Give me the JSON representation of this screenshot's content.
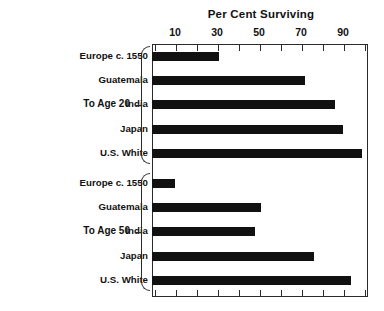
{
  "chart_data": {
    "type": "bar",
    "orientation": "horizontal",
    "title": "Per Cent Surviving",
    "xlabel": "",
    "ylabel": "",
    "xlim": [
      0,
      102
    ],
    "grid": false,
    "legend": false,
    "tick_labels": [
      "10",
      "30",
      "50",
      "70",
      "90"
    ],
    "tick_values": [
      10,
      30,
      50,
      70,
      90
    ],
    "minor_tick_values": [
      0,
      10,
      20,
      30,
      40,
      50,
      60,
      70,
      80,
      90,
      100
    ],
    "groups": [
      {
        "label": "To Age 20",
        "categories": [
          "Europe c. 1550",
          "Guatemala",
          "India",
          "Japan",
          "U.S. White"
        ],
        "values": [
          31,
          72,
          86,
          90,
          99
        ]
      },
      {
        "label": "To Age 50",
        "categories": [
          "Europe c. 1550",
          "Guatemala",
          "India",
          "Japan",
          "U.S. White"
        ],
        "values": [
          10,
          51,
          48,
          76,
          94
        ]
      }
    ],
    "bar_color": "#111111",
    "frame_color": "#2b2b2b",
    "background": "#ffffff"
  }
}
